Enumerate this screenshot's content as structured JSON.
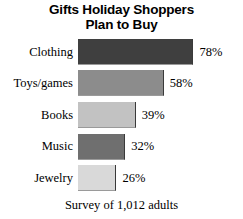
{
  "chart_data": {
    "type": "bar",
    "orientation": "horizontal",
    "title": "Gifts Holiday Shoppers Plan to Buy",
    "title_lines": [
      "Gifts Holiday Shoppers",
      "Plan to Buy"
    ],
    "footnote": "Survey of 1,012 adults",
    "xlabel": "",
    "ylabel": "",
    "xlim": [
      0,
      100
    ],
    "grid": false,
    "legend": "none",
    "categories": [
      "Clothing",
      "Toys/games",
      "Books",
      "Music",
      "Jewelry"
    ],
    "values": [
      78,
      58,
      39,
      32,
      26
    ],
    "value_labels": [
      "78%",
      "58%",
      "39%",
      "32%",
      "26%"
    ],
    "bar_colors": [
      "#3f3f3f",
      "#8c8c8c",
      "#c2c2c2",
      "#6f6f6f",
      "#d9d9d9"
    ],
    "bars": [
      {
        "category": "Clothing",
        "value": 78,
        "label": "78%",
        "color": "#3f3f3f"
      },
      {
        "category": "Toys/games",
        "value": 58,
        "label": "58%",
        "color": "#8c8c8c"
      },
      {
        "category": "Books",
        "value": 39,
        "label": "39%",
        "color": "#c2c2c2"
      },
      {
        "category": "Music",
        "value": 32,
        "label": "32%",
        "color": "#6f6f6f"
      },
      {
        "category": "Jewelry",
        "value": 26,
        "label": "26%",
        "color": "#d9d9d9"
      }
    ]
  }
}
